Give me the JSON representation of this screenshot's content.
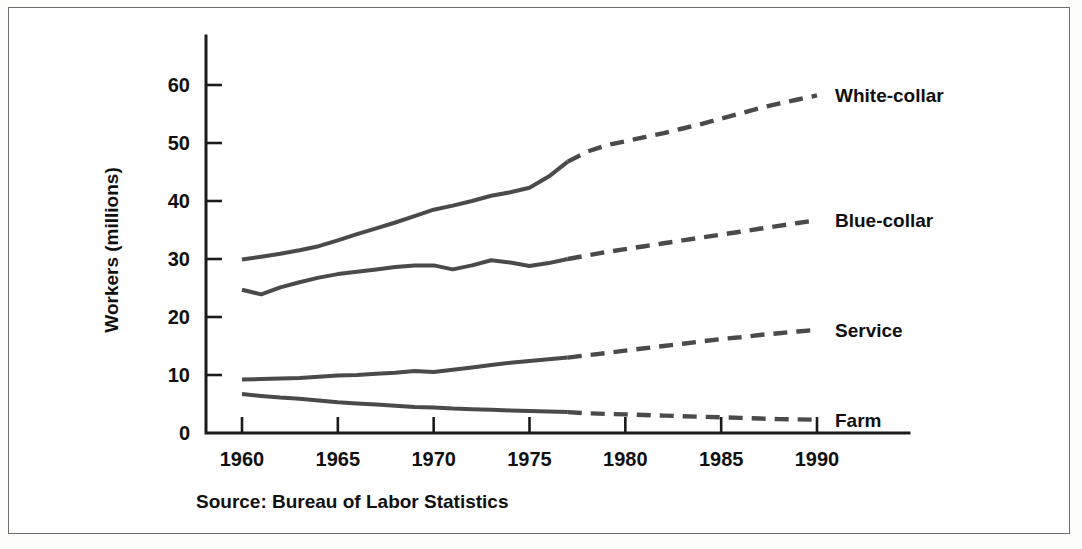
{
  "figure": {
    "source_note": "Source: Bureau of Labor Statistics",
    "frame_color": "#6e6e6e",
    "line_color": "#4a4a4a",
    "text_color": "#101010"
  },
  "chart_data": {
    "type": "line",
    "title": "",
    "xlabel": "",
    "ylabel": "Workers (millions)",
    "xlim": [
      1959,
      1992
    ],
    "ylim": [
      0,
      64
    ],
    "xticks": [
      1960,
      1965,
      1970,
      1975,
      1980,
      1985,
      1990
    ],
    "xtick_labels": [
      "1960",
      "1965",
      "1970",
      "1975",
      "1980",
      "1985",
      "1990"
    ],
    "yticks": [
      0,
      10,
      20,
      30,
      40,
      50,
      60
    ],
    "ytick_labels": [
      "0",
      "10",
      "20",
      "30",
      "40",
      "50",
      "60"
    ],
    "grid": false,
    "legend": "inline-right-of-line-ends",
    "projection_starts": 1977,
    "series": [
      {
        "name": "White-collar",
        "label": "White-collar",
        "style_actual": "solid",
        "style_projected": "dashed",
        "x": [
          1960,
          1961,
          1962,
          1963,
          1964,
          1965,
          1966,
          1967,
          1968,
          1969,
          1970,
          1971,
          1972,
          1973,
          1974,
          1975,
          1976,
          1977,
          1978,
          1979,
          1980,
          1981,
          1982,
          1983,
          1984,
          1985,
          1986,
          1987,
          1988,
          1989,
          1990
        ],
        "values": [
          29.9,
          30.4,
          30.9,
          31.5,
          32.2,
          33.2,
          34.3,
          35.3,
          36.3,
          37.4,
          38.5,
          39.2,
          40.0,
          40.9,
          41.5,
          42.3,
          44.2,
          46.8,
          48.5,
          49.6,
          50.3,
          51.0,
          51.7,
          52.5,
          53.3,
          54.2,
          55.1,
          56.0,
          56.8,
          57.5,
          58.2
        ]
      },
      {
        "name": "Blue-collar",
        "label": "Blue-collar",
        "style_actual": "solid",
        "style_projected": "dashed",
        "x": [
          1960,
          1961,
          1962,
          1963,
          1964,
          1965,
          1966,
          1967,
          1968,
          1969,
          1970,
          1971,
          1972,
          1973,
          1974,
          1975,
          1976,
          1977,
          1978,
          1979,
          1980,
          1981,
          1982,
          1983,
          1984,
          1985,
          1986,
          1987,
          1988,
          1989,
          1990
        ],
        "values": [
          24.7,
          23.9,
          25.1,
          26.0,
          26.8,
          27.4,
          27.8,
          28.2,
          28.6,
          28.9,
          28.9,
          28.2,
          28.9,
          29.8,
          29.4,
          28.8,
          29.3,
          30.0,
          30.6,
          31.2,
          31.7,
          32.2,
          32.7,
          33.2,
          33.7,
          34.2,
          34.7,
          35.2,
          35.7,
          36.2,
          36.7
        ]
      },
      {
        "name": "Service",
        "label": "Service",
        "style_actual": "solid",
        "style_projected": "dashed",
        "x": [
          1960,
          1961,
          1962,
          1963,
          1964,
          1965,
          1966,
          1967,
          1968,
          1969,
          1970,
          1971,
          1972,
          1973,
          1974,
          1975,
          1976,
          1977,
          1978,
          1979,
          1980,
          1981,
          1982,
          1983,
          1984,
          1985,
          1986,
          1987,
          1988,
          1989,
          1990
        ],
        "values": [
          9.2,
          9.3,
          9.4,
          9.5,
          9.7,
          9.9,
          10.0,
          10.2,
          10.4,
          10.7,
          10.5,
          10.9,
          11.3,
          11.7,
          12.1,
          12.4,
          12.7,
          13.0,
          13.4,
          13.8,
          14.2,
          14.6,
          15.0,
          15.4,
          15.8,
          16.2,
          16.5,
          16.9,
          17.2,
          17.5,
          17.8
        ]
      },
      {
        "name": "Farm",
        "label": "Farm",
        "style_actual": "solid",
        "style_projected": "dashed",
        "x": [
          1960,
          1961,
          1962,
          1963,
          1964,
          1965,
          1966,
          1967,
          1968,
          1969,
          1970,
          1971,
          1972,
          1973,
          1974,
          1975,
          1976,
          1977,
          1978,
          1979,
          1980,
          1981,
          1982,
          1983,
          1984,
          1985,
          1986,
          1987,
          1988,
          1989,
          1990
        ],
        "values": [
          6.7,
          6.4,
          6.1,
          5.9,
          5.6,
          5.3,
          5.1,
          4.9,
          4.7,
          4.5,
          4.4,
          4.2,
          4.1,
          4.0,
          3.9,
          3.8,
          3.7,
          3.6,
          3.4,
          3.3,
          3.2,
          3.1,
          3.0,
          2.9,
          2.8,
          2.7,
          2.6,
          2.5,
          2.4,
          2.35,
          2.3
        ]
      }
    ]
  }
}
